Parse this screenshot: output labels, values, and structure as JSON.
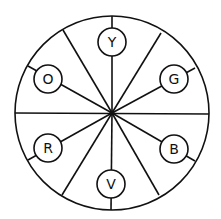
{
  "diagram": {
    "type": "color-wheel",
    "segments": 8,
    "labels": [
      {
        "id": "Y",
        "text": "Y",
        "position": "top"
      },
      {
        "id": "G",
        "text": "G",
        "position": "upper-right"
      },
      {
        "id": "B",
        "text": "B",
        "position": "lower-right"
      },
      {
        "id": "V",
        "text": "V",
        "position": "bottom"
      },
      {
        "id": "R",
        "text": "R",
        "position": "lower-left"
      },
      {
        "id": "O",
        "text": "O",
        "position": "upper-left"
      }
    ],
    "stroke_color": "#111111",
    "background_color": "#ffffff"
  }
}
